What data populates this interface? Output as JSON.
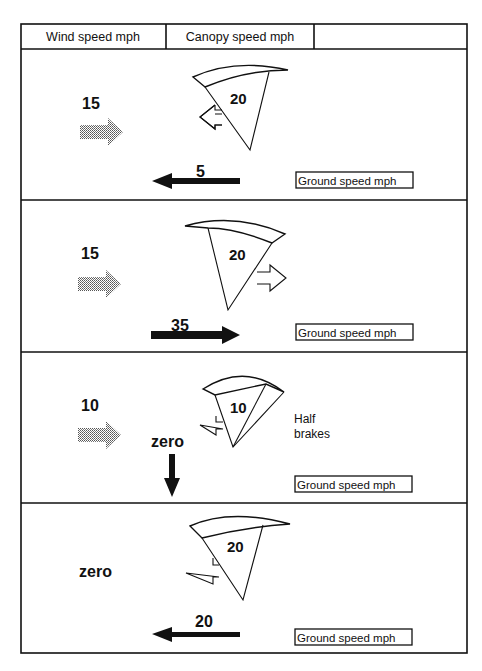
{
  "header": {
    "col1": "Wind speed  mph",
    "col2": "Canopy speed  mph",
    "col3": ""
  },
  "ground_label": "Ground speed  mph",
  "colors": {
    "line": "#111111",
    "wind_arrow_fill": "#8a8a8a",
    "background": "#ffffff"
  },
  "panels": [
    {
      "wind_speed": "15",
      "wind_direction": "right",
      "canopy_speed": "20",
      "canopy_direction": "left",
      "ground_speed": "5",
      "ground_direction": "left",
      "note": ""
    },
    {
      "wind_speed": "15",
      "wind_direction": "right",
      "canopy_speed": "20",
      "canopy_direction": "right",
      "ground_speed": "35",
      "ground_direction": "right",
      "note": ""
    },
    {
      "wind_speed": "10",
      "wind_direction": "right",
      "canopy_speed": "10",
      "canopy_direction": "left",
      "ground_speed": "zero",
      "ground_direction": "down",
      "note_line1": "Half",
      "note_line2": "brakes"
    },
    {
      "wind_speed": "zero",
      "wind_direction": "none",
      "canopy_speed": "20",
      "canopy_direction": "left",
      "ground_speed": "20",
      "ground_direction": "left",
      "note": ""
    }
  ]
}
